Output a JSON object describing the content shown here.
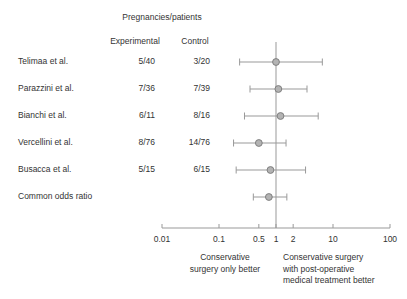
{
  "header": {
    "group_title": "Pregnancies/patients",
    "col_experimental": "Experimental",
    "col_control": "Control"
  },
  "axis_caption": {
    "left_line1": "Conservative",
    "left_line2": "surgery only better",
    "right_line1": "Conservative surgery",
    "right_line2": "with post-operative",
    "right_line3": "medical treatment better"
  },
  "style": {
    "line_color": "#999999",
    "marker_fill": "#b3b3b3",
    "marker_stroke": "#808080",
    "axis_color": "#999999",
    "text_color": "#333333"
  },
  "chart_data": {
    "type": "forest",
    "title": "Pregnancies/patients",
    "xlabel": "",
    "ylabel": "",
    "xscale": "log",
    "xlim": [
      0.01,
      100
    ],
    "null_line": 1,
    "ticks": [
      0.01,
      0.1,
      0.5,
      1,
      2,
      10,
      100
    ],
    "tick_labels": [
      "0.01",
      "0.1",
      "0.5",
      "1",
      "2",
      "10",
      "100"
    ],
    "effect_measure": "odds ratio",
    "grid": false,
    "legend": "none",
    "rows": [
      {
        "label": "Telimaa et al.",
        "experimental": "5/40",
        "control": "3/20",
        "or": 1.0,
        "ci_low": 0.23,
        "ci_high": 6.5,
        "summary": false
      },
      {
        "label": "Parazzini et al.",
        "experimental": "7/36",
        "control": "7/39",
        "or": 1.1,
        "ci_low": 0.35,
        "ci_high": 3.5,
        "summary": false
      },
      {
        "label": "Bianchi et al.",
        "experimental": "6/11",
        "control": "8/16",
        "or": 1.2,
        "ci_low": 0.28,
        "ci_high": 5.5,
        "summary": false
      },
      {
        "label": "Vercellini et al.",
        "experimental": "8/76",
        "control": "14/76",
        "or": 0.5,
        "ci_low": 0.18,
        "ci_high": 1.5,
        "summary": false
      },
      {
        "label": "Busacca et al.",
        "experimental": "5/15",
        "control": "6/15",
        "or": 0.8,
        "ci_low": 0.2,
        "ci_high": 3.3,
        "summary": false
      },
      {
        "label": "Common odds ratio",
        "experimental": "",
        "control": "",
        "or": 0.75,
        "ci_low": 0.4,
        "ci_high": 1.55,
        "summary": true
      }
    ]
  }
}
